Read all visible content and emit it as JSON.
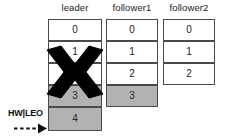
{
  "diagram": {
    "background_color": "#ffffff",
    "border_color": "#4a4a4a",
    "filled_color": "#b2b2b2",
    "empty_color": "#ffffff",
    "text_color": "#1a1a1a",
    "xmark_color": "#000000"
  },
  "columns": [
    {
      "id": "leader",
      "header": "leader",
      "cells": [
        {
          "label": "0",
          "filled": false
        },
        {
          "label": "1",
          "filled": false
        },
        {
          "label": "2",
          "filled": false
        },
        {
          "label": "3",
          "filled": true
        },
        {
          "label": "4",
          "filled": true
        }
      ]
    },
    {
      "id": "follower1",
      "header": "follower1",
      "cells": [
        {
          "label": "0",
          "filled": false
        },
        {
          "label": "1",
          "filled": false
        },
        {
          "label": "2",
          "filled": false
        },
        {
          "label": "3",
          "filled": true
        }
      ]
    },
    {
      "id": "follower2",
      "header": "follower2",
      "cells": [
        {
          "label": "0",
          "filled": false
        },
        {
          "label": "1",
          "filled": false
        },
        {
          "label": "2",
          "filled": false
        }
      ]
    }
  ],
  "annotations": {
    "failure_marker": {
      "icon": "x-cross-icon",
      "target_column": "leader",
      "description": "leader failure"
    },
    "watermark_pointer": {
      "label": "HW|LEO",
      "icon": "dashed-arrow-right-icon",
      "target_column": "leader",
      "target_cell": "4"
    }
  }
}
